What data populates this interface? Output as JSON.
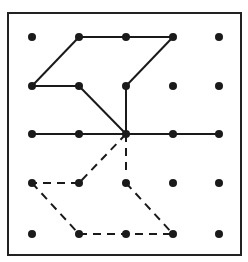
{
  "diagram": {
    "type": "dot-grid-figure",
    "frame": {
      "x": 8,
      "y": 13,
      "width": 233,
      "height": 242,
      "stroke": "#222222"
    },
    "grid": {
      "columns_x": [
        32,
        79,
        126,
        173,
        219
      ],
      "rows_y": [
        37,
        86,
        134,
        183,
        234
      ],
      "dot_radius": 4,
      "dot_color": "#1a1a1a"
    },
    "solid_segments": [
      [
        [
          79,
          37
        ],
        [
          173,
          37
        ]
      ],
      [
        [
          79,
          37
        ],
        [
          32,
          86
        ]
      ],
      [
        [
          32,
          86
        ],
        [
          79,
          86
        ]
      ],
      [
        [
          173,
          37
        ],
        [
          126,
          86
        ]
      ],
      [
        [
          126,
          86
        ],
        [
          126,
          134
        ]
      ],
      [
        [
          79,
          86
        ],
        [
          126,
          134
        ]
      ],
      [
        [
          32,
          134
        ],
        [
          219,
          134
        ]
      ]
    ],
    "dashed_segments": [
      [
        [
          126,
          134
        ],
        [
          79,
          183
        ]
      ],
      [
        [
          79,
          183
        ],
        [
          32,
          183
        ]
      ],
      [
        [
          126,
          134
        ],
        [
          126,
          172
        ]
      ],
      [
        [
          126,
          183
        ],
        [
          173,
          234
        ]
      ],
      [
        [
          32,
          183
        ],
        [
          79,
          234
        ]
      ],
      [
        [
          79,
          234
        ],
        [
          173,
          234
        ]
      ]
    ],
    "line_color": "#1a1a1a"
  }
}
